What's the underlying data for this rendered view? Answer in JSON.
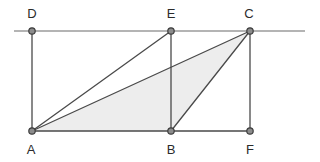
{
  "figure": {
    "canvas": {
      "width": 320,
      "height": 162
    },
    "colors": {
      "background": "#ffffff",
      "stroke": "#4a4a4a",
      "guide_stroke": "#6b6b6b",
      "shaded_fill": "#ededed",
      "vertex_fill": "#8c8c8c",
      "vertex_stroke": "#3c3c3c",
      "label_color": "#2b2b2b"
    },
    "vertices": [
      {
        "id": "D",
        "label": "D",
        "x": 32,
        "y": 31,
        "label_x": 32,
        "label_y": 18
      },
      {
        "id": "E",
        "label": "E",
        "x": 171,
        "y": 31,
        "label_x": 171,
        "label_y": 18
      },
      {
        "id": "C",
        "label": "C",
        "x": 250,
        "y": 31,
        "label_x": 249,
        "label_y": 18
      },
      {
        "id": "A",
        "label": "A",
        "x": 32,
        "y": 131,
        "label_x": 31,
        "label_y": 154
      },
      {
        "id": "B",
        "label": "B",
        "x": 171,
        "y": 131,
        "label_x": 171,
        "label_y": 154
      },
      {
        "id": "F",
        "label": "F",
        "x": 250,
        "y": 131,
        "label_x": 250,
        "label_y": 154
      }
    ],
    "vertex_radius": 3.2,
    "guides": [
      {
        "name": "top-extended-line",
        "x1": 14,
        "y1": 31,
        "x2": 305,
        "y2": 31
      }
    ],
    "edges": [
      {
        "name": "segment-A-B",
        "x1": 32,
        "y1": 131,
        "x2": 171,
        "y2": 131
      },
      {
        "name": "segment-B-F",
        "x1": 171,
        "y1": 131,
        "x2": 250,
        "y2": 131
      },
      {
        "name": "segment-D-A",
        "x1": 32,
        "y1": 31,
        "x2": 32,
        "y2": 131
      },
      {
        "name": "segment-E-B",
        "x1": 171,
        "y1": 31,
        "x2": 171,
        "y2": 131
      },
      {
        "name": "segment-C-F",
        "x1": 250,
        "y1": 31,
        "x2": 250,
        "y2": 131
      },
      {
        "name": "segment-A-E",
        "x1": 32,
        "y1": 131,
        "x2": 171,
        "y2": 31
      },
      {
        "name": "segment-A-C",
        "x1": 32,
        "y1": 131,
        "x2": 250,
        "y2": 31
      },
      {
        "name": "segment-B-C",
        "x1": 171,
        "y1": 131,
        "x2": 250,
        "y2": 31
      }
    ],
    "shaded_regions": [
      {
        "name": "triangle-A-B-C",
        "points": "32,131 171,131 250,31"
      }
    ]
  }
}
